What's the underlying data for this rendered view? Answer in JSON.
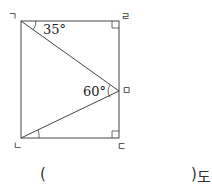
{
  "figure": {
    "shape": "rectangle with inscribed triangle",
    "vertices": {
      "top_left": "ㄱ",
      "top_right": "ㄹ",
      "mid_right": "ㅁ",
      "bottom_left": "ㄴ",
      "bottom_right": "ㄷ"
    },
    "angles": {
      "at_top_left": "35°",
      "at_mid_right": "60°"
    },
    "right_angles": [
      "ㄹ",
      "ㄷ"
    ]
  },
  "answer": {
    "open_paren": "(",
    "close_paren": ")",
    "unit": "도"
  }
}
